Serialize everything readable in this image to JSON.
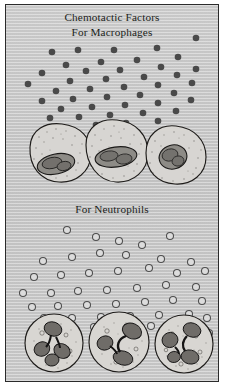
{
  "figure": {
    "name": "chemotactic-factors-diagram",
    "background_color": "#c9c9c9",
    "border_color": "#2b2b2b",
    "page_color": "#ffffff"
  },
  "captions": {
    "title_line1": "Chemotactic Factors",
    "title_line2": "For Macrophages",
    "section2": "For Neutrophils"
  },
  "legend": {
    "filled_dot_meaning": "chemotactic factor for macrophages",
    "open_circle_meaning": "chemotactic factor for neutrophils",
    "dot_color": "#4a4a4a",
    "ring_fill": "#dcdcdc",
    "ring_stroke": "#4d4d4d"
  },
  "panels": [
    {
      "id": "macrophage-panel",
      "label": "For Macrophages",
      "particle_style": "filled",
      "particle_count": 42,
      "cell_type": "macrophage",
      "cell_count": 3,
      "nucleus_description": "single kidney-shaped nucleus"
    },
    {
      "id": "neutrophil-panel",
      "label": "For Neutrophils",
      "particle_style": "open",
      "particle_count": 46,
      "cell_type": "neutrophil",
      "cell_count": 3,
      "nucleus_description": "multi-lobed segmented nucleus"
    }
  ],
  "chart_data": {
    "type": "scatter",
    "title": "Chemotactic Factors",
    "xlabel": "",
    "ylabel": "",
    "xlim": [
      0,
      214
    ],
    "ylim": [
      0,
      378
    ],
    "grid": false,
    "legend_position": "none",
    "series": [
      {
        "name": "For Macrophages",
        "marker": "filled-circle",
        "color": "#4a4a4a",
        "radius": 3.3,
        "points": [
          [
            190,
            33
          ],
          [
            151,
            43
          ],
          [
            108,
            45
          ],
          [
            72,
            45
          ],
          [
            46,
            47
          ],
          [
            172,
            52
          ],
          [
            131,
            55
          ],
          [
            95,
            57
          ],
          [
            60,
            60
          ],
          [
            155,
            62
          ],
          [
            114,
            65
          ],
          [
            190,
            64
          ],
          [
            80,
            66
          ],
          [
            36,
            68
          ],
          [
            171,
            70
          ],
          [
            138,
            72
          ],
          [
            100,
            74
          ],
          [
            64,
            76
          ],
          [
            22,
            79
          ],
          [
            186,
            78
          ],
          [
            152,
            80
          ],
          [
            118,
            82
          ],
          [
            84,
            84
          ],
          [
            50,
            86
          ],
          [
            168,
            88
          ],
          [
            134,
            90
          ],
          [
            101,
            92
          ],
          [
            67,
            94
          ],
          [
            36,
            96
          ],
          [
            185,
            95
          ],
          [
            152,
            98
          ],
          [
            119,
            100
          ],
          [
            86,
            102
          ],
          [
            55,
            104
          ],
          [
            170,
            106
          ],
          [
            137,
            108
          ],
          [
            104,
            110
          ],
          [
            73,
            112
          ],
          [
            44,
            113
          ],
          [
            152,
            116
          ],
          [
            120,
            118
          ],
          [
            90,
            120
          ]
        ]
      },
      {
        "name": "For Neutrophils",
        "marker": "open-circle",
        "color": "#4d4d4d",
        "radius": 3.5,
        "points": [
          [
            61,
            225
          ],
          [
            90,
            232
          ],
          [
            113,
            236
          ],
          [
            136,
            240
          ],
          [
            164,
            231
          ],
          [
            155,
            254
          ],
          [
            185,
            257
          ],
          [
            120,
            250
          ],
          [
            94,
            248
          ],
          [
            66,
            252
          ],
          [
            37,
            256
          ],
          [
            199,
            266
          ],
          [
            171,
            268
          ],
          [
            143,
            263
          ],
          [
            112,
            266
          ],
          [
            83,
            268
          ],
          [
            55,
            270
          ],
          [
            28,
            272
          ],
          [
            190,
            282
          ],
          [
            160,
            280
          ],
          [
            131,
            283
          ],
          [
            101,
            285
          ],
          [
            72,
            286
          ],
          [
            45,
            288
          ],
          [
            17,
            288
          ],
          [
            196,
            296
          ],
          [
            167,
            295
          ],
          [
            139,
            297
          ],
          [
            110,
            299
          ],
          [
            81,
            300
          ],
          [
            52,
            301
          ],
          [
            26,
            302
          ],
          [
            183,
            309
          ],
          [
            153,
            310
          ],
          [
            124,
            311
          ],
          [
            95,
            312
          ],
          [
            66,
            313
          ],
          [
            38,
            313
          ],
          [
            175,
            320
          ],
          [
            145,
            321
          ],
          [
            116,
            322
          ],
          [
            88,
            322
          ],
          [
            59,
            322
          ],
          [
            30,
            321
          ],
          [
            201,
            313
          ],
          [
            203,
            328
          ]
        ]
      }
    ]
  },
  "cells": {
    "macrophages": [
      {
        "cx": 52,
        "cy": 148,
        "rx": 33,
        "ry": 29,
        "nucleus": "kidney"
      },
      {
        "cx": 110,
        "cy": 146,
        "rx": 32,
        "ry": 31,
        "nucleus": "kidney"
      },
      {
        "cx": 170,
        "cy": 150,
        "rx": 31,
        "ry": 29,
        "nucleus": "kidney"
      }
    ],
    "neutrophils": [
      {
        "cx": 48,
        "cy": 338,
        "r": 29,
        "lobes": 4
      },
      {
        "cx": 113,
        "cy": 337,
        "r": 30,
        "lobes": 3
      },
      {
        "cx": 178,
        "cy": 339,
        "r": 29,
        "lobes": 4
      }
    ]
  }
}
